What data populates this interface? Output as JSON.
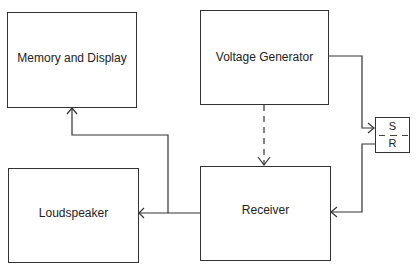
{
  "diagram": {
    "type": "block-diagram",
    "blocks": [
      {
        "id": "memory",
        "label": "Memory and Display"
      },
      {
        "id": "voltage",
        "label": "Voltage Generator"
      },
      {
        "id": "loudspeaker",
        "label": "Loudspeaker"
      },
      {
        "id": "receiver",
        "label": "Receiver"
      }
    ],
    "sr_element": {
      "top_label": "S",
      "bottom_label": "R"
    },
    "connections": [
      {
        "from": "voltage",
        "to": "sr_element",
        "style": "solid"
      },
      {
        "from": "sr_element",
        "to": "receiver",
        "style": "solid"
      },
      {
        "from": "voltage",
        "to": "receiver",
        "style": "dashed"
      },
      {
        "from": "receiver",
        "to": "loudspeaker",
        "style": "solid"
      },
      {
        "from": "receiver",
        "to": "memory",
        "style": "solid"
      }
    ]
  }
}
